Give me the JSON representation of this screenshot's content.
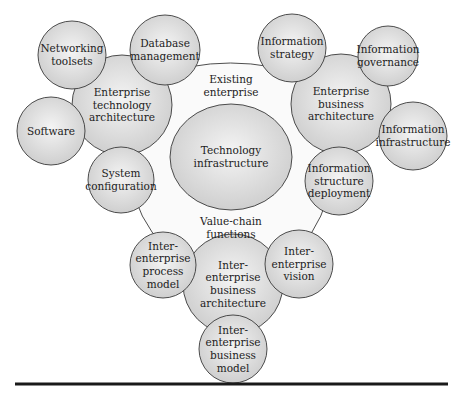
{
  "diagram": {
    "type": "bubble-cluster",
    "colors": {
      "circle_fill_center": "#f4f4f4",
      "circle_fill_edge": "#cfcfcf",
      "region_fill": "#fafafa",
      "stroke": "#3a3a3a",
      "rule": "#1a1a1a",
      "text": "#222222"
    },
    "region": {
      "id": "existing-enterprise",
      "labels": {
        "top": [
          "Existing",
          "enterprise"
        ],
        "bottom": [
          "Value-chain",
          "functions"
        ]
      }
    },
    "core": {
      "id": "technology-infrastructure",
      "lines": [
        "Technology",
        "infrastructure"
      ]
    },
    "nodes": [
      {
        "id": "networking-toolsets",
        "lines": [
          "Networking",
          "toolsets"
        ]
      },
      {
        "id": "database-management",
        "lines": [
          "Database",
          "management"
        ]
      },
      {
        "id": "enterprise-technology-architecture",
        "lines": [
          "Enterprise",
          "technology",
          "architecture"
        ]
      },
      {
        "id": "software",
        "lines": [
          "Software"
        ]
      },
      {
        "id": "system-configuration",
        "lines": [
          "System",
          "configuration"
        ]
      },
      {
        "id": "information-strategy",
        "lines": [
          "Information",
          "strategy"
        ]
      },
      {
        "id": "information-governance",
        "lines": [
          "Information",
          "governance"
        ]
      },
      {
        "id": "enterprise-business-architecture",
        "lines": [
          "Enterprise",
          "business",
          "architecture"
        ]
      },
      {
        "id": "information-infrastructure",
        "lines": [
          "Information",
          "infrastructure"
        ]
      },
      {
        "id": "information-structure-deployment",
        "lines": [
          "Information",
          "structure",
          "deployment"
        ]
      },
      {
        "id": "inter-enterprise-process-model",
        "lines": [
          "Inter-",
          "enterprise",
          "process",
          "model"
        ]
      },
      {
        "id": "inter-enterprise-vision",
        "lines": [
          "Inter-",
          "enterprise",
          "vision"
        ]
      },
      {
        "id": "inter-enterprise-business-architecture",
        "lines": [
          "Inter-",
          "enterprise",
          "business",
          "architecture"
        ]
      },
      {
        "id": "inter-enterprise-business-model",
        "lines": [
          "Inter-",
          "enterprise",
          "business",
          "model"
        ]
      }
    ]
  }
}
